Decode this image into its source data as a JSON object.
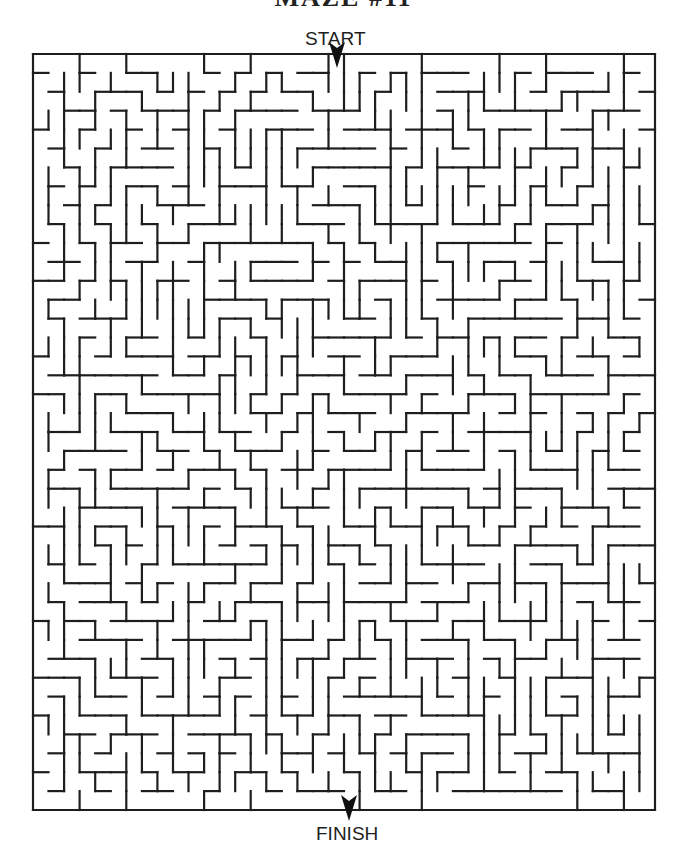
{
  "page": {
    "title_clipped": "MAZE #11",
    "start_label": "START",
    "finish_label": "FINISH"
  },
  "maze": {
    "origin_x": 33,
    "origin_y": 54,
    "width": 622,
    "height": 756,
    "cols": 40,
    "rows": 40,
    "start_col": 19,
    "finish_col": 20,
    "start_arrow": {
      "x": 337,
      "y": 56
    },
    "finish_arrow": {
      "x": 349,
      "y": 809
    },
    "wall_color": "#1e1e1e",
    "background_color": "#ffffff",
    "seed": 11
  }
}
